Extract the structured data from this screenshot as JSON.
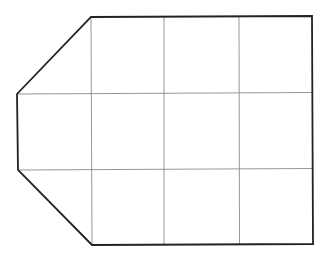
{
  "diagram": {
    "type": "polygon-grid",
    "colors": {
      "background": "#ffffff",
      "outline": "#222222",
      "grid": "#8a8a8a"
    },
    "outline_points": [
      [
        91,
        17
      ],
      [
        312,
        16
      ],
      [
        313,
        244
      ],
      [
        92,
        245
      ],
      [
        18,
        170
      ],
      [
        17,
        94
      ]
    ],
    "grid_vertical_x": [
      91,
      164,
      239
    ],
    "grid_horizontal_y": [
      93,
      169
    ],
    "grid_rows": 3,
    "grid_columns": 3
  }
}
